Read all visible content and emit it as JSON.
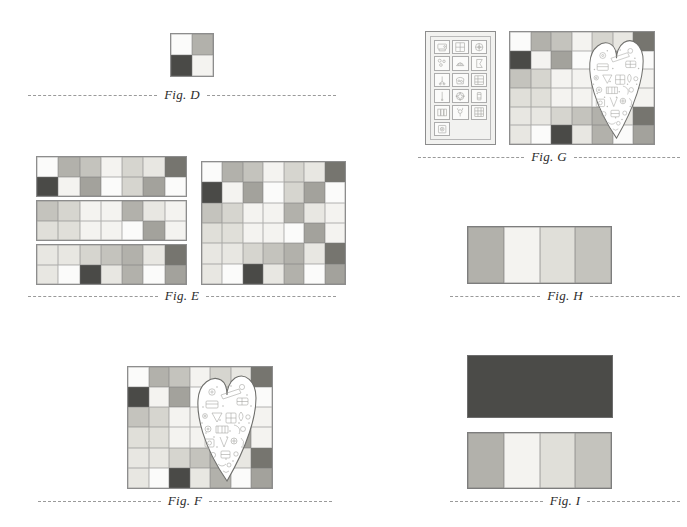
{
  "page": {
    "background": "#ffffff",
    "caption_color": "#2b2b2b",
    "rule_color": "#9a9a9a"
  },
  "palette": {
    "white": "#fbfbfa",
    "offwhite": "#f4f3f0",
    "cream": "#eeece6",
    "pale": "#e8e7e2",
    "light": "#e0dfd9",
    "lightgray": "#d6d5cf",
    "gray": "#c4c3bd",
    "midgray": "#b2b1ab",
    "medium": "#a3a29c",
    "dark": "#76756f",
    "darker": "#5c5b57",
    "charcoal": "#4a4a47",
    "panel_bg": "#f2f2f0",
    "solid_dark": "#4b4b48"
  },
  "figures": [
    {
      "id": "fig-d",
      "caption": "Fig. D",
      "kind": "patch-grid",
      "cols": 2,
      "rows": 2,
      "cells": [
        "white",
        "midgray",
        "charcoal",
        "offwhite"
      ]
    },
    {
      "id": "fig-e",
      "caption": "Fig. E",
      "kind": "rows-plus-grid",
      "strips": [
        {
          "name": "strip-row-1",
          "cols": 7,
          "rows": 2,
          "cells": [
            "white",
            "midgray",
            "gray",
            "offwhite",
            "lightgray",
            "pale",
            "dark",
            "charcoal",
            "offwhite",
            "medium",
            "white",
            "lightgray",
            "medium",
            "white"
          ]
        },
        {
          "name": "strip-row-2",
          "cols": 7,
          "rows": 2,
          "cells": [
            "gray",
            "lightgray",
            "offwhite",
            "offwhite",
            "midgray",
            "pale",
            "offwhite",
            "light",
            "light",
            "offwhite",
            "offwhite",
            "white",
            "medium",
            "offwhite"
          ]
        },
        {
          "name": "strip-row-3",
          "cols": 7,
          "rows": 2,
          "cells": [
            "pale",
            "pale",
            "lightgray",
            "gray",
            "midgray",
            "pale",
            "dark",
            "pale",
            "white",
            "charcoal",
            "pale",
            "midgray",
            "white",
            "medium"
          ]
        }
      ],
      "assembled": {
        "name": "assembled-grid",
        "cols": 7,
        "rows": 6,
        "cells": [
          "white",
          "midgray",
          "gray",
          "offwhite",
          "lightgray",
          "pale",
          "dark",
          "charcoal",
          "offwhite",
          "medium",
          "white",
          "lightgray",
          "medium",
          "white",
          "gray",
          "lightgray",
          "offwhite",
          "offwhite",
          "midgray",
          "pale",
          "offwhite",
          "light",
          "light",
          "offwhite",
          "offwhite",
          "white",
          "medium",
          "offwhite",
          "pale",
          "pale",
          "lightgray",
          "gray",
          "midgray",
          "pale",
          "dark",
          "pale",
          "white",
          "charcoal",
          "pale",
          "midgray",
          "white",
          "medium"
        ]
      }
    },
    {
      "id": "fig-f",
      "caption": "Fig. F",
      "kind": "grid-with-heart",
      "cols": 7,
      "rows": 6,
      "cells": [
        "white",
        "midgray",
        "gray",
        "offwhite",
        "lightgray",
        "pale",
        "dark",
        "charcoal",
        "offwhite",
        "medium",
        "white",
        "lightgray",
        "medium",
        "white",
        "gray",
        "lightgray",
        "offwhite",
        "offwhite",
        "midgray",
        "pale",
        "offwhite",
        "light",
        "light",
        "offwhite",
        "offwhite",
        "white",
        "medium",
        "offwhite",
        "pale",
        "pale",
        "lightgray",
        "gray",
        "midgray",
        "pale",
        "dark",
        "pale",
        "white",
        "charcoal",
        "pale",
        "midgray",
        "white",
        "medium"
      ],
      "appliqué": "heart-appliqué"
    },
    {
      "id": "fig-g",
      "caption": "Fig. G",
      "kind": "panel-plus-grid-with-heart",
      "panel": {
        "name": "printed-fabric-panel",
        "motifs": [
          "sewing-machine-icon",
          "pin-cushion-grid-icon",
          "spool-wheel-icon",
          "buttons-icon",
          "thread-spools-icon",
          "pennant-icon",
          "scissors-icon",
          "notions-basket-icon",
          "window-block-icon",
          "needle-icon",
          "pincushion-star-icon",
          "bobbin-icon",
          "thimble-row-icon",
          "flower-icon",
          "grid-block-icon",
          "button-tag-icon"
        ]
      },
      "cols": 7,
      "rows": 6,
      "cells": [
        "white",
        "midgray",
        "gray",
        "offwhite",
        "lightgray",
        "pale",
        "dark",
        "charcoal",
        "offwhite",
        "medium",
        "white",
        "lightgray",
        "medium",
        "white",
        "gray",
        "lightgray",
        "offwhite",
        "offwhite",
        "midgray",
        "pale",
        "offwhite",
        "light",
        "light",
        "offwhite",
        "offwhite",
        "white",
        "medium",
        "offwhite",
        "pale",
        "pale",
        "lightgray",
        "gray",
        "midgray",
        "pale",
        "dark",
        "pale",
        "white",
        "charcoal",
        "pale",
        "midgray",
        "white",
        "medium"
      ],
      "appliqué": "heart-appliqué"
    },
    {
      "id": "fig-h",
      "caption": "Fig. H",
      "kind": "band-strip",
      "bands": [
        "midgray",
        "offwhite",
        "light",
        "gray"
      ]
    },
    {
      "id": "fig-i",
      "caption": "Fig. I",
      "kind": "solid-plus-band-strip",
      "solid": "solid_dark",
      "bands": [
        "midgray",
        "offwhite",
        "light",
        "gray"
      ]
    }
  ]
}
